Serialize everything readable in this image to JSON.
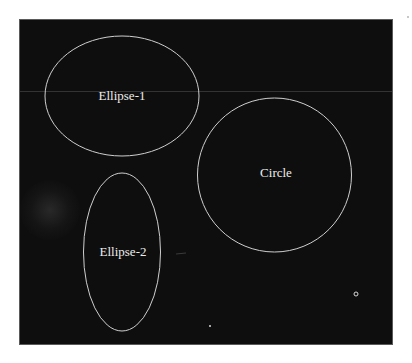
{
  "diagram": {
    "background_color": "#0e0e0e",
    "outline_color": "#cfcfcf",
    "label_color": "#ececec",
    "shapes": [
      {
        "type": "ellipse",
        "label": "Ellipse-1",
        "cx": 122,
        "cy": 96,
        "rx": 77,
        "ry": 60
      },
      {
        "type": "circle",
        "label": "Circle",
        "cx": 274.5,
        "cy": 175,
        "r": 77
      },
      {
        "type": "ellipse",
        "label": "Ellipse-2",
        "cx": 122,
        "cy": 252,
        "rx": 38.5,
        "ry": 79
      }
    ],
    "markers": [
      {
        "type": "small-ring",
        "cx": 356,
        "cy": 294,
        "r": 2
      },
      {
        "type": "dot",
        "cx": 210,
        "cy": 326,
        "r": 1
      }
    ]
  }
}
